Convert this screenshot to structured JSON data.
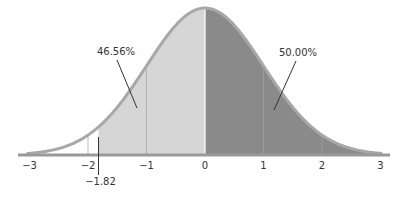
{
  "chart_data": {
    "type": "area",
    "title": "",
    "subtitle": "Standard normal distribution with shaded areas",
    "xlabel": "",
    "ylabel": "",
    "xlim": [
      -3,
      3
    ],
    "x_ticks": [
      -3,
      -2,
      -1,
      0,
      1,
      2,
      3
    ],
    "x_tick_labels": [
      "−3",
      "−2",
      "−1",
      "0",
      "1",
      "2",
      "3"
    ],
    "grid": false,
    "legend": null,
    "distribution": {
      "name": "standard normal",
      "mean": 0,
      "sd": 1
    },
    "marker": {
      "x": -1.82,
      "label": "−1.82"
    },
    "regions": [
      {
        "name": "left-shaded",
        "from": -1.82,
        "to": 0,
        "area_percent": 46.56,
        "label": "46.56%",
        "color": "#d6d6d6"
      },
      {
        "name": "right-shaded",
        "from": 0,
        "to": 3,
        "area_percent": 50.0,
        "label": "50.00%",
        "color": "#8a8a8a"
      }
    ],
    "vertical_guides": [
      -2,
      -1,
      0,
      1,
      2
    ],
    "annotations": [
      {
        "text": "46.56%",
        "points_to_x": -1.25
      },
      {
        "text": "50.00%",
        "points_to_x": 1.0
      }
    ]
  },
  "colors": {
    "curve": "#a8a8a8",
    "axis": "#999999",
    "light_fill": "#d6d6d6",
    "dark_fill": "#8a8a8a",
    "text": "#333333"
  }
}
